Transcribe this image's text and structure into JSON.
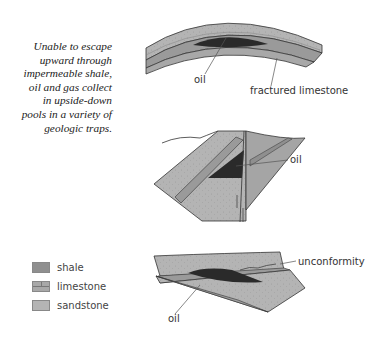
{
  "caption": {
    "lines": [
      "Unable to escape",
      "upward through",
      "impermeable shale,",
      "oil and gas collect",
      "in upside-down",
      "pools in a variety of",
      "geologic traps."
    ]
  },
  "diagrams": {
    "anticline": {
      "labels": {
        "oil": "oil",
        "fractured_limestone": "fractured limestone"
      }
    },
    "fault": {
      "labels": {
        "oil": "oil"
      }
    },
    "unconformity": {
      "labels": {
        "unconformity": "unconformity",
        "oil": "oil"
      }
    }
  },
  "legend": {
    "items": [
      {
        "label": "shale",
        "pattern": "shale"
      },
      {
        "label": "limestone",
        "pattern": "limestone"
      },
      {
        "label": "sandstone",
        "pattern": "sandstone"
      }
    ]
  },
  "colors": {
    "shale": "#8f8f8f",
    "limestone": "#a8a8a8",
    "sandstone": "#b4b4b4",
    "oil": "#2a2a2a",
    "outline": "#333333"
  }
}
